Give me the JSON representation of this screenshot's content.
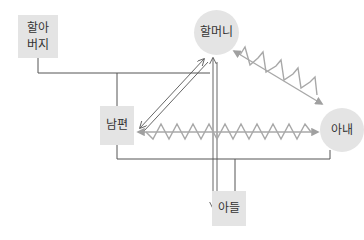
{
  "diagram": {
    "type": "genogram",
    "colors": {
      "node_fill": "#e4e4e4",
      "line": "#555555",
      "conflict_line": "#a8a8a8",
      "text": "#333333"
    },
    "nodes": {
      "grandfather": {
        "label_line1": "할아",
        "label_line2": "버지",
        "shape": "square"
      },
      "grandmother": {
        "label": "할머니",
        "shape": "circle"
      },
      "husband": {
        "label": "남편",
        "shape": "square"
      },
      "wife": {
        "label": "아내",
        "shape": "circle"
      },
      "son": {
        "label": "아들",
        "shape": "square"
      }
    },
    "relations": [
      {
        "from": "grandfather",
        "to": "grandmother",
        "type": "marriage"
      },
      {
        "from": "grandfather+grandmother",
        "to": "husband",
        "type": "child"
      },
      {
        "from": "husband",
        "to": "wife",
        "type": "marriage"
      },
      {
        "from": "husband+wife",
        "to": "son",
        "type": "child"
      },
      {
        "from": "husband",
        "to": "grandmother",
        "type": "close-bidirectional"
      },
      {
        "from": "grandmother",
        "to": "son",
        "type": "close-bidirectional"
      },
      {
        "from": "grandmother",
        "to": "wife",
        "type": "conflict"
      },
      {
        "from": "husband",
        "to": "wife",
        "type": "conflict"
      }
    ]
  }
}
